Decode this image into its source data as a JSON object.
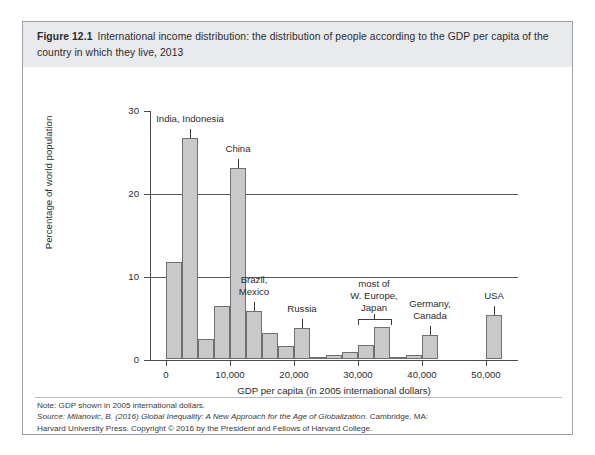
{
  "caption": {
    "figure_number": "Figure 12.1",
    "title": "International income distribution: the distribution of people according to the GDP per capita of the country in which they live, 2013"
  },
  "footer": {
    "note": "Note: GDP shown in 2005 international dollars.",
    "source_prefix": "Source: Milanovic, B. (2016) ",
    "source_italic": "Global Inequality: A New Approach for the Age of Globalization.",
    "source_suffix": " Cambridge, MA:",
    "source_line2": "Harvard University Press. Copyright © 2016 by the President and Fellows of Harvard College."
  },
  "chart_data": {
    "type": "bar",
    "title": "International income distribution: the distribution of people according to the GDP per capita of the country in which they live, 2013",
    "xlabel": "GDP per capita (in 2005 international dollars)",
    "ylabel": "Percentage of world population",
    "xlim": [
      -2500,
      55000
    ],
    "ylim": [
      0,
      30
    ],
    "x_ticks": [
      0,
      10000,
      20000,
      30000,
      40000,
      50000
    ],
    "x_tick_labels": [
      "0",
      "10,000",
      "20,000",
      "30,000",
      "40,000",
      "50,000"
    ],
    "y_ticks": [
      0,
      10,
      20,
      30
    ],
    "y_tick_labels": [
      "0",
      "10",
      "20",
      "30"
    ],
    "gridlines": [
      10,
      20
    ],
    "grid": true,
    "legend": "none",
    "bin_width": 2500,
    "bar_color": "#c9c9c9",
    "bar_edge_color": "#6f6f6f",
    "bins": [
      {
        "x0": 0,
        "x1": 2500,
        "value": 11.8
      },
      {
        "x0": 2500,
        "x1": 5000,
        "value": 26.8
      },
      {
        "x0": 5000,
        "x1": 7500,
        "value": 2.5
      },
      {
        "x0": 7500,
        "x1": 10000,
        "value": 6.5
      },
      {
        "x0": 10000,
        "x1": 12500,
        "value": 23.1
      },
      {
        "x0": 12500,
        "x1": 15000,
        "value": 5.8
      },
      {
        "x0": 15000,
        "x1": 17500,
        "value": 3.2
      },
      {
        "x0": 17500,
        "x1": 20000,
        "value": 1.6
      },
      {
        "x0": 20000,
        "x1": 22500,
        "value": 3.8
      },
      {
        "x0": 22500,
        "x1": 25000,
        "value": 0.35
      },
      {
        "x0": 25000,
        "x1": 27500,
        "value": 0.55
      },
      {
        "x0": 27500,
        "x1": 30000,
        "value": 0.9
      },
      {
        "x0": 30000,
        "x1": 32500,
        "value": 1.8
      },
      {
        "x0": 32500,
        "x1": 35000,
        "value": 3.9
      },
      {
        "x0": 35000,
        "x1": 37500,
        "value": 0.3
      },
      {
        "x0": 37500,
        "x1": 40000,
        "value": 0.55
      },
      {
        "x0": 40000,
        "x1": 42500,
        "value": 2.9
      },
      {
        "x0": 50000,
        "x1": 52500,
        "value": 5.4
      }
    ],
    "annotations": [
      {
        "label": "India, Indonesia",
        "x": 3750,
        "value": 26.8,
        "leader": "line"
      },
      {
        "label": "China",
        "x": 11250,
        "value": 23.1,
        "leader": "line"
      },
      {
        "label": "Brazil,\nMexico",
        "x": 13750,
        "value": 5.8,
        "leader": "line"
      },
      {
        "label": "Russia",
        "x": 21250,
        "value": 3.8,
        "leader": "line"
      },
      {
        "label": "most of\nW. Europe,\nJapan",
        "x": 32500,
        "value": 3.9,
        "leader": "bracket",
        "bracket_x0": 30000,
        "bracket_x1": 35000
      },
      {
        "label": "Germany,\nCanada",
        "x": 41250,
        "value": 2.9,
        "leader": "line"
      },
      {
        "label": "USA",
        "x": 51250,
        "value": 5.4,
        "leader": "line"
      }
    ]
  }
}
